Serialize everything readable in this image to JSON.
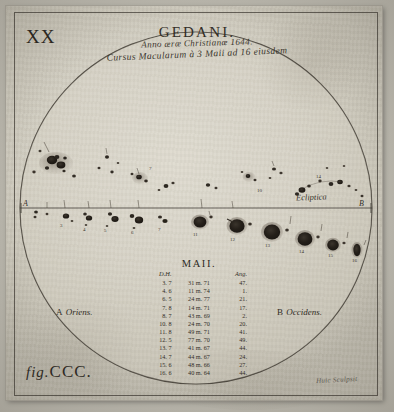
{
  "plate": {
    "number": "XX",
    "figure_label_prefix": "fig.",
    "figure_label": "CCC.",
    "engraver_signature": "Huic Sculpsit"
  },
  "header": {
    "title": "GEDANI.",
    "title_initial": "G",
    "title_rest": "EDANI.",
    "line1": "Anno æræ Christianæ 1644.",
    "line2": "Cursus Macularum à 3 Maii ad 16 eiusdem"
  },
  "disk": {
    "ecliptic_label": "Ecliptica",
    "endpoint_left": "A",
    "endpoint_right": "B",
    "orientation_left_letter": "A",
    "orientation_left_word": "Oriens.",
    "orientation_right_letter": "B",
    "orientation_right_word": "Occidens."
  },
  "table": {
    "month_heading": "MAII.",
    "columns": [
      "D.H.",
      "",
      "Ang."
    ],
    "rows": [
      [
        "3. 7",
        "31 m. 71",
        "47."
      ],
      [
        "4. 6",
        "11 m. 74",
        "1."
      ],
      [
        "6. 5",
        "24 m. 77",
        "21."
      ],
      [
        "7. 8",
        "14 m. 71",
        "17."
      ],
      [
        "8. 7",
        "43 m. 69",
        "2."
      ],
      [
        "10. 8",
        "24 m. 70",
        "20."
      ],
      [
        "11. 8",
        "49 m. 71",
        "41."
      ],
      [
        "12. 5",
        "77 m. 70",
        "49."
      ],
      [
        "13. 7",
        "41 m. 67",
        "44."
      ],
      [
        "14. 7",
        "44 m. 67",
        "24."
      ],
      [
        "15. 6",
        "48 m. 66",
        "27."
      ],
      [
        "16. 6",
        "40 m. 64",
        "44."
      ]
    ]
  },
  "spots": {
    "upper_labels": [
      "1",
      "2",
      "3",
      "4",
      "5",
      "6",
      "7",
      "8",
      "9",
      "10",
      "11",
      "12",
      "13",
      "14",
      "15",
      "16"
    ],
    "lower_labels": [
      "3",
      "4",
      "5",
      "6",
      "7",
      "8",
      "9",
      "10",
      "11",
      "12",
      "13",
      "14",
      "15",
      "16"
    ]
  },
  "colors": {
    "paper": "#d8d4c8",
    "ink": "#2e2a24",
    "spot": "#241f1a",
    "penumbra": "#6b635a",
    "frame": "#2d2822"
  }
}
